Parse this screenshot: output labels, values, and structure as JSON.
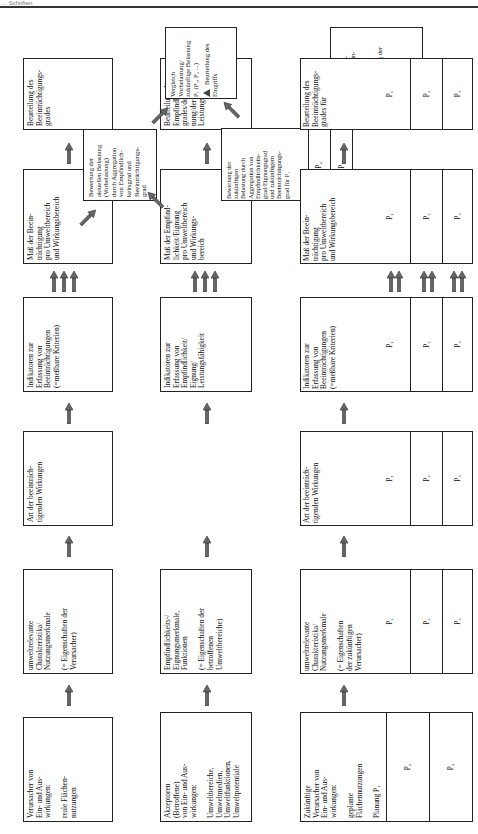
{
  "header": {
    "text": "... Schriften"
  },
  "row1": {
    "boxes": [
      {
        "text": "Verursacher von\nEin- und Aus-\nwirkungen:\n\nreale Flächen-\nnutzungen"
      },
      {
        "text": "umweltrelevante\nCharakteristika/\nNutzungsmerkmale\n\n(= Eigenschaften der\nVerursacher)"
      },
      {
        "text": "Art der beeinträch-\ntigenden Wirkungen"
      },
      {
        "text": "Indikatoren zur\nErfassung von\nBeeinträchtigungen\n(=meßbare Kriterien)"
      },
      {
        "text": "Maß der Beein-\nträchtigung\npro Umweltbereich\nund Wirkungsbereich"
      },
      {
        "text": "Beurteilung des\nBeeinträchtigungs-\ngrades"
      }
    ]
  },
  "row2": {
    "boxes": [
      {
        "text": "Akzeptoren\n(Betroffene)\nvon Ein- und Aus-\nwirkungen:\n\nUmweltbereiche,\nUmweltmedien,\nUmweltfunktionen,\nUmweltpotentiale"
      },
      {
        "text": "Empfindlichkeits-/\nEignungsmerkmale,\nFunktionen\n\n(= Eigenschaften der\nbetroffenen\nUmweltbereiche)"
      },
      {
        "text": "Indikatoren zur\nErfassung von\nEmpfindlichkeit/\nEignung/\nLeistungsfähigkeit"
      },
      {
        "text": "Maß der Empfind-\nlichkeit/Eignung\npro Umweltbereich\nund Wirkungs-\nbereich"
      },
      {
        "text": "Beurteilung des\nEmpfindlichkeits-\ngrades/der Eig-\nnung/der\nLeistungsfähigkeit"
      }
    ]
  },
  "middle": {
    "current_assessment": {
      "text": "Bewertung der\naktuellen Belastung\n(Vorbelastung)\ndurch Aggregation\nvon Empfindlich-\nkeitsgrad und\nBeeinträchtigungs-\ngrad"
    },
    "comparison_1": {
      "text": "Vergleich\nVorbelastung/\nzukünftige Belastung\nP₁ (P₂, P₃ ...)",
      "result": "Beurteilung des\nEingriffs"
    }
  },
  "row3": {
    "boxes": [
      {
        "text": "Zukünftige\nVerursacher von\nEin- und Aus-\nwirkungen:\n\ngeplante\nFlächennutzungen\n\nPlanung P₁",
        "cells": [
          "P₂",
          "P₃"
        ]
      },
      {
        "text": "umweltrelevante\nCharakteristika/\nNutzungsmerkmale\n\n(= Eigenschaften\nder zukünftigen\nVerursacher)",
        "cells": [
          "P₁",
          "P₂",
          "P₃"
        ]
      },
      {
        "text": "Art der beeinträch-\ntigenden Wirkungen",
        "cells": [
          "P₁",
          "P₂",
          "P₃"
        ]
      },
      {
        "text": "Indikatoren zur\nErfassung von\nBeeinträchtigungen\n(=meßbare Kriterien)",
        "cells": [
          "P₁",
          "P₂",
          "P₃"
        ]
      },
      {
        "text": "Maß der Beein-\nträchtigung\npro Umweltbereich\nund Wirkungsbereich",
        "cells": [
          "P₁",
          "P₂",
          "P₃"
        ]
      },
      {
        "text": "Beurteilung des\nBeeinträchtigungs-\ngrades für",
        "cells": [
          "P₁",
          "P₂",
          "P₃"
        ]
      }
    ],
    "future_assessment": {
      "text": "Bewertung der\nzukünftigen\nBelastung durch\nAggregation von\nEmpfindlichkeits-\ngrad/Eignungsgrad\nund zukünftigem\nBeeinträchtigungs-\ngrad für P₁",
      "cells": [
        "P₂",
        "P₃"
      ]
    },
    "comparison_2": {
      "text": "Vergleich\nzukünftiger Be-\nlastungen mitein-\nander\nP₁ - P₂ - P₃",
      "result": "Ermittlung der\nVariante mit\nminimaler\nBelastung"
    }
  }
}
